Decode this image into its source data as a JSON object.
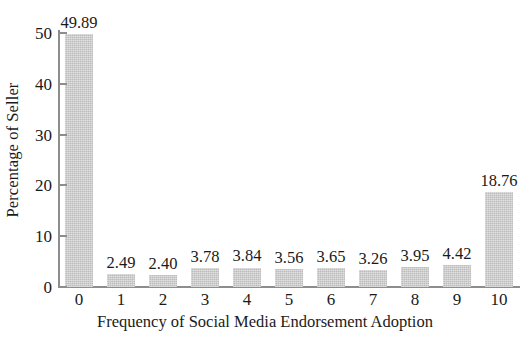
{
  "chart_data": {
    "type": "bar",
    "title": "",
    "xlabel": "Frequency of Social Media Endorsement Adoption",
    "ylabel": "Percentage of Seller",
    "categories": [
      "0",
      "1",
      "2",
      "3",
      "4",
      "5",
      "6",
      "7",
      "8",
      "9",
      "10"
    ],
    "values": [
      49.89,
      2.49,
      2.4,
      3.78,
      3.84,
      3.56,
      3.65,
      3.26,
      3.95,
      4.42,
      18.76
    ],
    "value_labels": [
      "49.89",
      "2.49",
      "2.40",
      "3.78",
      "3.84",
      "3.56",
      "3.65",
      "3.26",
      "3.95",
      "4.42",
      "18.76"
    ],
    "ylim": [
      0,
      50
    ],
    "yticks": [
      0,
      10,
      20,
      30,
      40,
      50
    ],
    "ytick_labels": [
      "0",
      "10",
      "20",
      "30",
      "40",
      "50"
    ],
    "xlim_categories": 11,
    "grid": false,
    "legend": false,
    "bar_color": "#c9c9c9",
    "axis_color": "#8d8d8d",
    "text_color": "#1a1a1a",
    "background_color": "#ffffff"
  }
}
